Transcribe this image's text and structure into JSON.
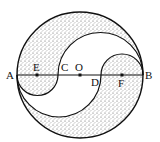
{
  "diagram": {
    "type": "geometry",
    "points": {
      "A": {
        "label": "A",
        "x": 17,
        "y": 75
      },
      "E": {
        "label": "E",
        "x": 37,
        "y": 75
      },
      "C": {
        "label": "C",
        "x": 58,
        "y": 75
      },
      "O": {
        "label": "O",
        "x": 80,
        "y": 75
      },
      "D": {
        "label": "D",
        "x": 101,
        "y": 75
      },
      "F": {
        "label": "F",
        "x": 122,
        "y": 75
      },
      "B": {
        "label": "B",
        "x": 143,
        "y": 75
      }
    },
    "colors": {
      "stroke": "#111111",
      "shade": "#8a8a8a",
      "background": "#ffffff"
    }
  }
}
